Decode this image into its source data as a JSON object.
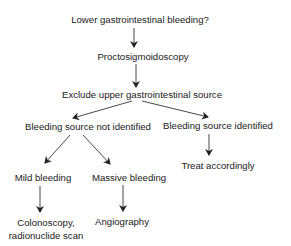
{
  "diagram": {
    "type": "flowchart",
    "nodes": {
      "start": "Lower gastrointestinal bleeding?",
      "procto": "Proctosigmoidoscopy",
      "exclude": "Exclude upper gastrointestinal source",
      "not_identified": "Bleeding source not identified",
      "identified": "Bleeding source identified",
      "treat": "Treat accordingly",
      "mild": "Mild bleeding",
      "massive": "Massive bleeding",
      "colonoscopy_line1": "Colonoscopy,",
      "colonoscopy_line2": "radionuclide scan",
      "angiography": "Angiography"
    },
    "edges": [
      {
        "from": "start",
        "to": "procto"
      },
      {
        "from": "procto",
        "to": "exclude"
      },
      {
        "from": "exclude",
        "to": "not_identified"
      },
      {
        "from": "exclude",
        "to": "identified"
      },
      {
        "from": "not_identified",
        "to": "mild"
      },
      {
        "from": "not_identified",
        "to": "massive"
      },
      {
        "from": "identified",
        "to": "treat"
      },
      {
        "from": "mild",
        "to": "colonoscopy"
      },
      {
        "from": "massive",
        "to": "angiography"
      }
    ],
    "colors": {
      "text": "#1a1a1a",
      "line": "#333333",
      "background": "#ffffff"
    }
  }
}
